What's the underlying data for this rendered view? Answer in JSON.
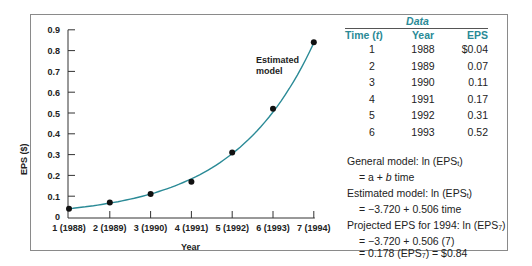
{
  "chart_data": {
    "type": "line",
    "title": "",
    "xlabel": "Year",
    "ylabel": "EPS ($)",
    "x_ticks": [
      "1 (1988)",
      "2 (1989)",
      "3 (1990)",
      "4 (1991)",
      "5 (1992)",
      "6 (1993)",
      "7 (1994)"
    ],
    "y_ticks": [
      "0",
      "0.1",
      "0.2",
      "0.3",
      "0.4",
      "0.5",
      "0.6",
      "0.7",
      "0.8",
      "0.9"
    ],
    "ylim": [
      0,
      0.9
    ],
    "xlim": [
      1,
      7
    ],
    "grid": false,
    "series": [
      {
        "name": "Observed EPS",
        "style": "points",
        "x": [
          1,
          2,
          3,
          4,
          5,
          6,
          7
        ],
        "values": [
          0.04,
          0.07,
          0.11,
          0.17,
          0.31,
          0.52,
          0.84
        ]
      },
      {
        "name": "Estimated model",
        "style": "line",
        "color": "#2a8a96",
        "x": [
          1,
          2,
          3,
          4,
          5,
          6,
          7
        ],
        "values": [
          0.04,
          0.07,
          0.11,
          0.18,
          0.31,
          0.51,
          0.84
        ]
      }
    ],
    "annotations": [
      "Estimated model"
    ]
  },
  "chart": {
    "y_axis_label": "EPS ($)",
    "x_axis_label": "Year",
    "annotation_line1": "Estimated",
    "annotation_line2": "model",
    "y_ticks": [
      "0",
      "0.1",
      "0.2",
      "0.3",
      "0.4",
      "0.5",
      "0.6",
      "0.7",
      "0.8",
      "0.9"
    ],
    "x_ticks": [
      "1 (1988)",
      "2 (1989)",
      "3 (1990)",
      "4 (1991)",
      "5 (1992)",
      "6 (1993)",
      "7 (1994)"
    ],
    "line_color": "#2a8a96"
  },
  "data_panel": {
    "title": "Data",
    "headers": {
      "time": "Time (",
      "time_var": "t",
      "time_close": ")",
      "year": "Year",
      "eps": "EPS"
    },
    "rows": [
      {
        "time": "1",
        "year": "1988",
        "eps": "$0.04"
      },
      {
        "time": "2",
        "year": "1989",
        "eps": "0.07"
      },
      {
        "time": "3",
        "year": "1990",
        "eps": "0.11"
      },
      {
        "time": "4",
        "year": "1991",
        "eps": "0.17"
      },
      {
        "time": "5",
        "year": "1992",
        "eps": "0.31"
      },
      {
        "time": "6",
        "year": "1993",
        "eps": "0.52"
      }
    ],
    "accent_color": "#2a8a96"
  },
  "equations": {
    "general_label": "General model: ln (EPS",
    "general_sub": "t",
    "general_close": ")",
    "general_rhs_a": "= a + ",
    "general_rhs_b": "b",
    "general_rhs_c": " time",
    "estimated_label": "Estimated model: ln (EPS",
    "estimated_sub": "t",
    "estimated_close": ")",
    "estimated_rhs": "= −3.720 + 0.506 time",
    "projected_label": "Projected EPS for 1994:   ln (EPS",
    "projected_sub": "7",
    "projected_close": ")",
    "projected_line2": "= −3.720 + 0.506 (7)",
    "projected_line3_a": "= 0.178 (EPS",
    "projected_line3_sub": "7",
    "projected_line3_b": ") = $0.84"
  }
}
